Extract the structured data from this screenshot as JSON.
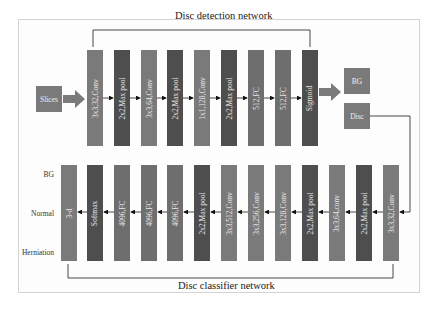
{
  "detection": {
    "title": "Disc detection network",
    "input_label": "Slices",
    "layers": [
      {
        "label": "3x3,32,Conv",
        "kind": "conv"
      },
      {
        "label": "2x2,Max pool",
        "kind": "pool"
      },
      {
        "label": "3x3,64,Conv",
        "kind": "conv"
      },
      {
        "label": "2x2,Max pool",
        "kind": "pool"
      },
      {
        "label": "1x1,128,Conv",
        "kind": "conv"
      },
      {
        "label": "2x2,Max pool",
        "kind": "pool"
      },
      {
        "label": "512,FC",
        "kind": "fc"
      },
      {
        "label": "512,FC",
        "kind": "fc"
      },
      {
        "label": "Sigmoid",
        "kind": "pool"
      }
    ],
    "outputs": [
      "BG",
      "Disc"
    ]
  },
  "classifier": {
    "title": "Disc classifier network",
    "layers_right_to_left": [
      {
        "label": "3x3,32,Conv",
        "kind": "conv"
      },
      {
        "label": "2x2,Max pool",
        "kind": "pool"
      },
      {
        "label": "3x3,64,conv",
        "kind": "conv"
      },
      {
        "label": "2x2,Max pool",
        "kind": "pool"
      },
      {
        "label": "3x3,128,Conv",
        "kind": "conv"
      },
      {
        "label": "3x3,256,Conv",
        "kind": "conv"
      },
      {
        "label": "3x3,512,Conv",
        "kind": "conv"
      },
      {
        "label": "2x2,Max pool",
        "kind": "pool"
      },
      {
        "label": "4096,FC",
        "kind": "fc"
      },
      {
        "label": "4096,FC",
        "kind": "fc"
      },
      {
        "label": "4096,FC",
        "kind": "fc"
      },
      {
        "label": "Softmax",
        "kind": "pool"
      },
      {
        "label": "3-d",
        "kind": "conv"
      }
    ],
    "class_labels": [
      "BG",
      "Normal",
      "Herniation"
    ]
  },
  "colors": {
    "conv": "#7a7a7a",
    "pool": "#4e4e4e",
    "fc": "#6e6e6e",
    "line": "#1a1a1a"
  }
}
